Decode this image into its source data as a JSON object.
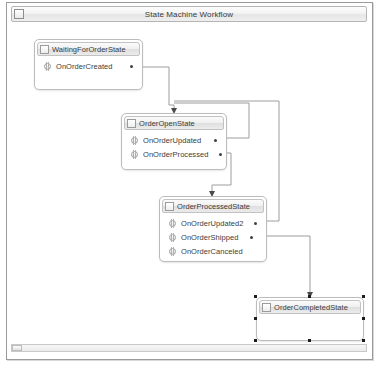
{
  "window": {
    "title": "State Machine Workflow",
    "icon": "window-restore-icon"
  },
  "canvas": {
    "states": [
      {
        "id": "waiting-for-order-state",
        "name": "WaitingForOrderState",
        "icon": "state-activity-icon",
        "selected": false,
        "x": 23,
        "y": 14,
        "width": 109,
        "height": 51,
        "events": [
          {
            "id": "on-order-created",
            "label": "OnOrderCreated",
            "icon": "event-driven-activity-icon"
          }
        ]
      },
      {
        "id": "order-open-state",
        "name": "OrderOpenState",
        "icon": "state-activity-icon",
        "selected": false,
        "x": 110,
        "y": 88,
        "width": 106,
        "height": 57,
        "events": [
          {
            "id": "on-order-updated",
            "label": "OnOrderUpdated",
            "icon": "event-driven-activity-icon"
          },
          {
            "id": "on-order-processed",
            "label": "OnOrderProcessed",
            "icon": "event-driven-activity-icon"
          }
        ]
      },
      {
        "id": "order-processed-state",
        "name": "OrderProcessedState",
        "icon": "state-activity-icon",
        "selected": false,
        "x": 148,
        "y": 171,
        "width": 108,
        "height": 66,
        "events": [
          {
            "id": "on-order-updated-2",
            "label": "OnOrderUpdated2",
            "icon": "event-driven-activity-icon"
          },
          {
            "id": "on-order-shipped",
            "label": "OnOrderShipped",
            "icon": "event-driven-activity-icon"
          },
          {
            "id": "on-order-canceled",
            "label": "OnOrderCanceled",
            "icon": "event-driven-activity-icon"
          }
        ]
      },
      {
        "id": "order-completed-state",
        "name": "OrderCompletedState",
        "icon": "state-activity-icon",
        "selected": true,
        "x": 245,
        "y": 272,
        "width": 108,
        "height": 44,
        "events": []
      }
    ],
    "connectors": [
      {
        "id": "created-to-open",
        "from": "on-order-created",
        "to": "order-open-state"
      },
      {
        "id": "updated-to-open",
        "from": "on-order-updated",
        "to": "order-open-state"
      },
      {
        "id": "processed-to-processed-state",
        "from": "on-order-processed",
        "to": "order-processed-state"
      },
      {
        "id": "updated2-to-processed-state",
        "from": "on-order-updated-2",
        "to": "order-processed-state"
      },
      {
        "id": "shipped-to-completed",
        "from": "on-order-shipped",
        "to": "order-completed-state"
      }
    ]
  },
  "scrollbar": {
    "orientation": "horizontal",
    "thumb_label": "horizontal-scroll-thumb"
  },
  "colors": {
    "frame_border": "#9a9a9a",
    "box_border": "#bcbcbc",
    "header_gradient_top": "#fbfbfb",
    "header_gradient_bottom": "#ebebeb",
    "connector_line": "#9d9d9d",
    "connector_dot": "#404040",
    "selection_handle": "#1c1c1c",
    "text": "#3c3c3c"
  }
}
